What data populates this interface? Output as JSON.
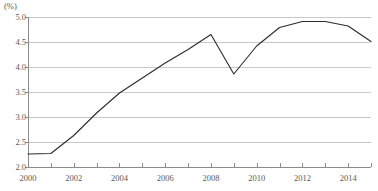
{
  "chart_data": {
    "type": "line",
    "title": "",
    "subtitle": "",
    "unit_label": "(%)",
    "xlabel": "",
    "ylabel": "",
    "ylim": [
      2.0,
      5.0
    ],
    "xlim": [
      2000,
      2015
    ],
    "grid": true,
    "grid_axis": "y",
    "legend": false,
    "legend_position": "none",
    "y_ticks": [
      "5.0",
      "4.5",
      "4.0",
      "3.5",
      "3.0",
      "2.5",
      "2.0"
    ],
    "y_tick_values": [
      5.0,
      4.5,
      4.0,
      3.5,
      3.0,
      2.5,
      2.0
    ],
    "x_ticks": [
      "2000",
      "2002",
      "2004",
      "2006",
      "2008",
      "2010",
      "2012",
      "2014"
    ],
    "x_tick_values": [
      2000,
      2002,
      2004,
      2006,
      2008,
      2010,
      2012,
      2014
    ],
    "x_minor_tick_values": [
      2000,
      2001,
      2002,
      2003,
      2004,
      2005,
      2006,
      2007,
      2008,
      2009,
      2010,
      2011,
      2012,
      2013,
      2014,
      2015
    ],
    "x": [
      2000,
      2001,
      2002,
      2003,
      2004,
      2005,
      2006,
      2007,
      2008,
      2009,
      2010,
      2011,
      2012,
      2013,
      2014,
      2015
    ],
    "values": [
      2.26,
      2.27,
      2.63,
      3.08,
      3.48,
      3.78,
      4.08,
      4.35,
      4.65,
      3.86,
      4.42,
      4.79,
      4.91,
      4.91,
      4.82,
      4.51
    ],
    "series": [
      {
        "name": "",
        "values": [
          2.26,
          2.27,
          2.63,
          3.08,
          3.48,
          3.78,
          4.08,
          4.35,
          4.65,
          3.86,
          4.42,
          4.79,
          4.91,
          4.91,
          4.82,
          4.51
        ]
      }
    ],
    "markers": false,
    "annotations": []
  },
  "colors": {
    "line": "#2b2b2b",
    "gridline": "#c8c8c8",
    "axis": "#8c8c8c",
    "tick_text": "#5a5a5a",
    "background": "#ffffff"
  }
}
